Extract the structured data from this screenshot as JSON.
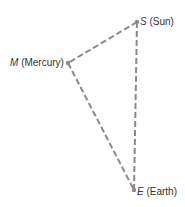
{
  "diagram": {
    "type": "triangle",
    "line_style": "dashed",
    "line_color": "#8a8a8a",
    "point_color": "#8a8a8a",
    "points": {
      "S": {
        "symbol": "S",
        "name": "(Sun)",
        "x": 137,
        "y": 22
      },
      "M": {
        "symbol": "M",
        "name": "(Mercury)",
        "x": 68,
        "y": 63
      },
      "E": {
        "symbol": "E",
        "name": "(Earth)",
        "x": 134,
        "y": 190
      }
    },
    "edges": [
      [
        "S",
        "M"
      ],
      [
        "M",
        "E"
      ],
      [
        "S",
        "E"
      ]
    ]
  }
}
